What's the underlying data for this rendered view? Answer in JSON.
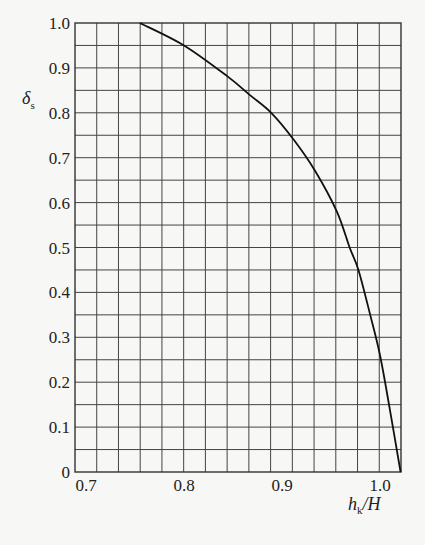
{
  "chart_data": {
    "type": "line",
    "title": "",
    "xlabel": "h_k/H",
    "ylabel": "δ_s",
    "xlim": [
      0.689,
      1.022
    ],
    "ylim": [
      0,
      1.0
    ],
    "grid": true,
    "x_ticks": [
      0.7,
      0.8,
      0.9,
      1.0
    ],
    "x_tick_labels": [
      "0.7",
      "0.8",
      "0.9",
      "1.0"
    ],
    "y_ticks": [
      0,
      0.1,
      0.2,
      0.3,
      0.4,
      0.5,
      0.6,
      0.7,
      0.8,
      0.9,
      1.0
    ],
    "y_tick_labels": [
      "0",
      "0.1",
      "0.2",
      "0.3",
      "0.4",
      "0.5",
      "0.6",
      "0.7",
      "0.8",
      "0.9",
      "1.0"
    ],
    "legend": null,
    "series": [
      {
        "name": "δs vs hk/H",
        "x": [
          0.755,
          0.8,
          0.845,
          0.867,
          0.889,
          0.912,
          0.934,
          0.956,
          0.969,
          0.978,
          0.99,
          1.0,
          1.01,
          1.021
        ],
        "y": [
          1.0,
          0.95,
          0.88,
          0.84,
          0.8,
          0.74,
          0.67,
          0.58,
          0.5,
          0.45,
          0.35,
          0.26,
          0.14,
          0.0
        ]
      }
    ]
  },
  "labels": {
    "x_axis_main": "h",
    "x_axis_sub": "k",
    "x_axis_tail": "/H",
    "y_axis_main": "δ",
    "y_axis_sub": "s"
  }
}
